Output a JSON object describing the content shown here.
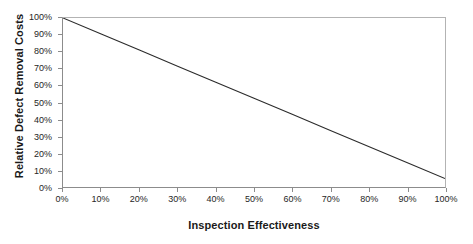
{
  "chart_data": {
    "type": "line",
    "title": "",
    "xlabel": "Inspection Effectiveness",
    "ylabel": "Relative Defect Removal Costs",
    "xlim": [
      0,
      100
    ],
    "ylim": [
      0,
      100
    ],
    "grid": false,
    "legend": "none",
    "x_tick_labels": [
      "0%",
      "10%",
      "20%",
      "30%",
      "40%",
      "50%",
      "60%",
      "70%",
      "80%",
      "90%",
      "100%"
    ],
    "x_tick_values": [
      0,
      10,
      20,
      30,
      40,
      50,
      60,
      70,
      80,
      90,
      100
    ],
    "y_tick_labels": [
      "0%",
      "10%",
      "20%",
      "30%",
      "40%",
      "50%",
      "60%",
      "70%",
      "80%",
      "90%",
      "100%"
    ],
    "y_tick_values": [
      0,
      10,
      20,
      30,
      40,
      50,
      60,
      70,
      80,
      90,
      100
    ],
    "series": [
      {
        "name": "Relative Defect Removal Costs",
        "color": "#2b2b2b",
        "x": [
          0,
          10,
          20,
          30,
          40,
          50,
          60,
          70,
          80,
          90,
          100
        ],
        "values": [
          100,
          90.5,
          81,
          71.5,
          62,
          52.5,
          43,
          33.5,
          24,
          14.5,
          5
        ]
      }
    ],
    "annotations": []
  },
  "style": {
    "line_color": "#2b2b2b",
    "frame_color": "#b3b3b3",
    "axis_color": "#8c8c8c",
    "text_color": "#1a1a1a",
    "background": "#ffffff"
  }
}
